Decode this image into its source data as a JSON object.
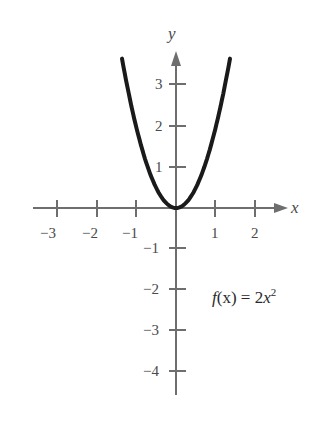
{
  "chart_data": {
    "type": "line",
    "title": "",
    "xlabel": "x",
    "ylabel": "y",
    "function": "f(x) = 2x^2",
    "annotation": "f(x) = 2x²",
    "xlim": [
      -3.6,
      2.8
    ],
    "ylim": [
      -4.6,
      3.7
    ],
    "x_ticks": [
      -3,
      -2,
      -1,
      1,
      2
    ],
    "y_ticks": [
      -4,
      -3,
      -2,
      -1,
      1,
      2,
      3
    ],
    "grid": false,
    "legend": null,
    "series": [
      {
        "name": "f(x) = 2x^2",
        "x": [
          -1.35,
          -1.2,
          -1.0,
          -0.8,
          -0.6,
          -0.4,
          -0.2,
          0,
          0.2,
          0.4,
          0.6,
          0.8,
          1.0,
          1.2,
          1.35
        ],
        "y": [
          3.645,
          2.88,
          2.0,
          1.28,
          0.72,
          0.32,
          0.08,
          0,
          0.08,
          0.32,
          0.72,
          1.28,
          2.0,
          2.88,
          3.645
        ]
      }
    ]
  },
  "labels": {
    "x_axis": "x",
    "y_axis": "y",
    "x_ticks": [
      "−3",
      "−2",
      "−1",
      "1",
      "2"
    ],
    "y_ticks_pos": [
      "1",
      "2",
      "3"
    ],
    "y_ticks_neg": [
      "−1",
      "−2",
      "−3",
      "−4"
    ],
    "func_name": "f",
    "func_arg": "(x)",
    "func_eq": " = 2",
    "func_var": "x",
    "func_exp": "2"
  },
  "colors": {
    "axis": "#6e6e6e",
    "curve": "#1a1a1a",
    "text": "#4a4a4a"
  }
}
